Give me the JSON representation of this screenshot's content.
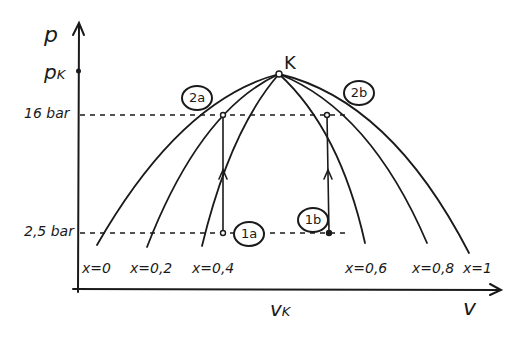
{
  "diagram": {
    "type": "p-v diagram (hand-drawn)",
    "axes": {
      "y_label": "p",
      "x_label": "v",
      "y_ticks": [
        "p_K",
        "16 bar",
        "2,5 bar"
      ],
      "x_ticks": [
        "v_K"
      ]
    },
    "critical_point": {
      "label": "K"
    },
    "labels": {
      "p_axis": "p",
      "pk": "p",
      "pk_sub": "K",
      "p16": "16 bar",
      "p25": "2,5 bar",
      "v_axis": "v",
      "vk": "v",
      "vk_sub": "K",
      "k": "K"
    },
    "quality_lines": [
      {
        "label": "x=0"
      },
      {
        "label": "x=0,2"
      },
      {
        "label": "x=0,4"
      },
      {
        "label": "x=0,6"
      },
      {
        "label": "x=0,8"
      },
      {
        "label": "x=1"
      }
    ],
    "states": {
      "s1a": "1a",
      "s1b": "1b",
      "s2a": "2a",
      "s2b": "2b"
    },
    "colors": {
      "ink": "#1a1a1a",
      "background": "#ffffff"
    }
  }
}
